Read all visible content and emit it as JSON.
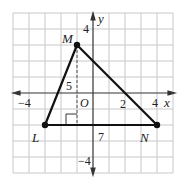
{
  "figure": {
    "type": "coordinate-plane-triangle",
    "colors": {
      "background": "#ffffff",
      "grid": "#c8c8c8",
      "axis": "#333333",
      "triangle": "#111111",
      "text": "#222222"
    },
    "grid": {
      "x_min": -5,
      "x_max": 5,
      "y_min": -5,
      "y_max": 5,
      "step": 1
    },
    "axes": {
      "x_label": "x",
      "y_label": "y"
    },
    "tick_labels": {
      "x_neg4": "−4",
      "x_2": "2",
      "x_4": "4",
      "y_4": "4",
      "y_neg4": "−4",
      "origin": "O"
    },
    "vertices": [
      {
        "name": "M",
        "x": -1,
        "y": 3
      },
      {
        "name": "L",
        "x": -3,
        "y": -2
      },
      {
        "name": "N",
        "x": 4,
        "y": -2
      }
    ],
    "measurements": {
      "height_label": "5",
      "base_label": "7"
    }
  }
}
